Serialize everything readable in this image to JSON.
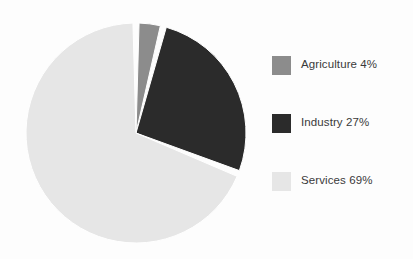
{
  "chart_data": {
    "type": "pie",
    "title": "",
    "subtitle": "",
    "xlabel": "",
    "ylabel": "",
    "grid": false,
    "legend_position": "right",
    "start_angle_deg": 0,
    "direction": "clockwise",
    "categories": [
      "Agriculture",
      "Industry",
      "Services"
    ],
    "values": [
      4,
      27,
      69
    ],
    "unit": "%",
    "slice_colors": [
      "#8c8c8c",
      "#2b2b2b",
      "#e6e6e6"
    ],
    "separator_color": "#ffffff",
    "slices": [
      {
        "label": "Agriculture",
        "value": 4,
        "display": "Agriculture 4%",
        "color": "#8c8c8c",
        "start_deg": 0,
        "end_deg": 14.4
      },
      {
        "label": "Industry",
        "value": 27,
        "display": "Industry 27%",
        "color": "#2b2b2b",
        "start_deg": 14.4,
        "end_deg": 111.6
      },
      {
        "label": "Services",
        "value": 69,
        "display": "Services 69%",
        "color": "#e6e6e6",
        "start_deg": 111.6,
        "end_deg": 360
      }
    ]
  },
  "legend": {
    "items": [
      {
        "label": "Agriculture 4%",
        "color": "#8c8c8c",
        "swatch_name": "agriculture"
      },
      {
        "label": "Industry 27%",
        "color": "#2b2b2b",
        "swatch_name": "industry"
      },
      {
        "label": "Services 69%",
        "color": "#e6e6e6",
        "swatch_name": "services"
      }
    ]
  },
  "colors": {
    "background": "#fdfdfd",
    "text": "#3a3a3a",
    "agriculture": "#8c8c8c",
    "industry": "#2b2b2b",
    "services": "#e6e6e6"
  }
}
